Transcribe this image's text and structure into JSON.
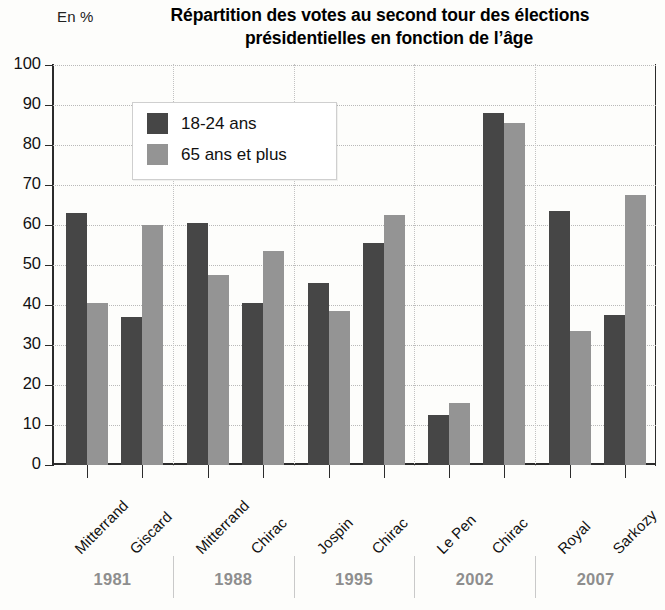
{
  "chart_data": {
    "type": "bar",
    "title": "Répartition des votes au second tour des élections présidentielles en fonction de l’âge",
    "title_line1": "Répartition des votes au second tour des élections",
    "title_line2": "présidentielles en fonction de l’âge",
    "ylabel": "En %",
    "xlabel": "",
    "ylim": [
      0,
      100
    ],
    "ytick_step": 10,
    "ytick_labels": [
      "100",
      "90",
      "80",
      "70",
      "60",
      "50",
      "40",
      "30",
      "20",
      "10",
      "0"
    ],
    "grid": true,
    "legend_position": "inside-top-left",
    "series": [
      {
        "name": "18-24 ans",
        "color": "#464646",
        "values": [
          63,
          37,
          60.5,
          40.5,
          45.5,
          55.5,
          12.5,
          88,
          63.5,
          37.5
        ]
      },
      {
        "name": "65 ans et plus",
        "color": "#949494",
        "values": [
          40.5,
          60,
          47.5,
          53.5,
          38.5,
          62.5,
          15.5,
          85.5,
          33.5,
          67.5
        ]
      }
    ],
    "categories": [
      "Mitterrand",
      "Giscard",
      "Mitterrand",
      "Chirac",
      "Jospin",
      "Chirac",
      "Le Pen",
      "Chirac",
      "Royal",
      "Sarkozy"
    ],
    "groups": [
      {
        "year": "1981",
        "candidates": [
          "Mitterrand",
          "Giscard"
        ]
      },
      {
        "year": "1988",
        "candidates": [
          "Mitterrand",
          "Chirac"
        ]
      },
      {
        "year": "1995",
        "candidates": [
          "Jospin",
          "Chirac"
        ]
      },
      {
        "year": "2002",
        "candidates": [
          "Le Pen",
          "Chirac"
        ]
      },
      {
        "year": "2007",
        "candidates": [
          "Royal",
          "Sarkozy"
        ]
      }
    ],
    "colors": {
      "young": "#464646",
      "old": "#949494",
      "axis": "#2b2b2b",
      "grid": "#b9b9b9",
      "year_label": "#8e8e8e"
    }
  },
  "legend": {
    "items": [
      {
        "label": "18-24 ans",
        "color": "#464646"
      },
      {
        "label": "65 ans et plus",
        "color": "#949494"
      }
    ]
  }
}
